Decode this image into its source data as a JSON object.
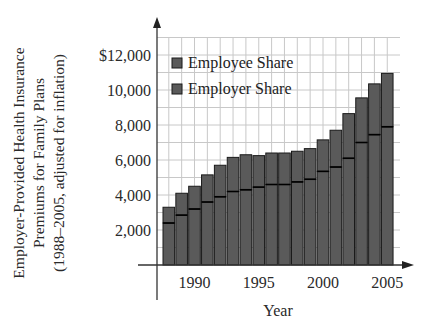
{
  "chart_data": {
    "type": "bar",
    "stacked": true,
    "title": "",
    "ylabel_lines": [
      "Employer-Provided Health Insurance",
      "Premiums for Family Plans",
      "(1988–2005, adjusted for inflation)"
    ],
    "ylabel": "Employer-Provided Health Insurance Premiums for Family Plans (1988–2005, adjusted for inflation)",
    "xlabel": "Year",
    "categories": [
      "1988",
      "1989",
      "1990",
      "1991",
      "1992",
      "1993",
      "1994",
      "1995",
      "1996",
      "1997",
      "1998",
      "1999",
      "2000",
      "2001",
      "2002",
      "2003",
      "2004",
      "2005"
    ],
    "series": [
      {
        "name": "Employer Share",
        "values": [
          2400,
          2850,
          3200,
          3600,
          3900,
          4200,
          4300,
          4450,
          4600,
          4600,
          4750,
          4900,
          5350,
          5600,
          6100,
          7000,
          7450,
          7900
        ]
      },
      {
        "name": "Employee Share",
        "values": [
          900,
          1250,
          1300,
          1550,
          1800,
          1950,
          2000,
          1800,
          1800,
          1800,
          1750,
          1750,
          1800,
          2100,
          2550,
          2550,
          2900,
          3050
        ]
      }
    ],
    "totals": [
      3300,
      4100,
      4500,
      5150,
      5700,
      6150,
      6300,
      6250,
      6400,
      6400,
      6500,
      6650,
      7150,
      7700,
      8650,
      9550,
      10350,
      10950
    ],
    "ylim": [
      0,
      13000
    ],
    "yticks": [
      2000,
      4000,
      6000,
      8000,
      10000,
      12000
    ],
    "ytick_labels": [
      "2,000",
      "4,000",
      "6,000",
      "8,000",
      "10,000",
      "$12,000"
    ],
    "xtick_labels": [
      "1990",
      "1995",
      "2000",
      "2005"
    ],
    "grid": true,
    "grid_minor_y_step": 1000,
    "legend": {
      "position": "upper-left",
      "entries": [
        "Employee Share",
        "Employer Share"
      ]
    },
    "colors": {
      "bar_fill": "#5a5a5a",
      "bar_edge": "#1a1a1a",
      "grid": "#c8c8c8",
      "axis": "#333333"
    }
  }
}
